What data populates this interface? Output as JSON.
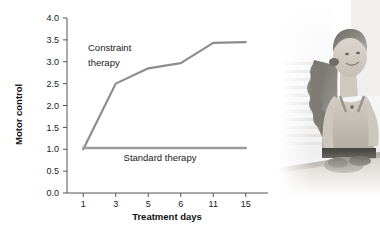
{
  "figure": {
    "kind": "line-chart-with-photo"
  },
  "chart_data": {
    "type": "line",
    "title": "",
    "subtitle": "",
    "xlabel": "Treatment days",
    "ylabel": "Motor control",
    "categories": [
      "1",
      "3",
      "5",
      "6",
      "11",
      "15"
    ],
    "ylim": [
      0.0,
      4.0
    ],
    "ytick_step": 0.5,
    "yticks": [
      "0.0",
      "0.5",
      "1.0",
      "1.5",
      "2.0",
      "2.5",
      "3.0",
      "3.5",
      "4.0"
    ],
    "grid": false,
    "legend": "inline-annotations",
    "series": [
      {
        "name": "Constraint therapy",
        "values": [
          1.0,
          2.5,
          2.85,
          2.97,
          3.43,
          3.45
        ],
        "color": "#8c8c8c",
        "annotation": {
          "line1": "Constraint",
          "line2": "therapy"
        }
      },
      {
        "name": "Standard therapy",
        "values": [
          1.03,
          1.03,
          1.03,
          1.03,
          1.03,
          1.03
        ],
        "color": "#9b9b9b",
        "annotation": {
          "line1": "Standard therapy",
          "line2": ""
        }
      }
    ],
    "axis_color": "#555555",
    "text_color": "#1a1a1a"
  },
  "photo": {
    "alt": "woman-seated-at-table",
    "description": "Young woman with curly ponytail wearing a tank top, seated at a table in a bright room"
  }
}
